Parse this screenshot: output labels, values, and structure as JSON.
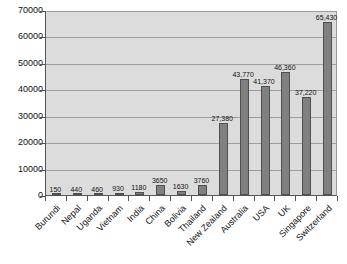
{
  "chart_data": {
    "type": "bar",
    "title": "",
    "xlabel": "",
    "ylabel": "",
    "ylim": [
      0,
      70000
    ],
    "grid": true,
    "legend": "none",
    "y_ticks": [
      {
        "value": 70000,
        "label": "70000"
      },
      {
        "value": 60000,
        "label": "60000"
      },
      {
        "value": 50000,
        "label": "50000"
      },
      {
        "value": 40000,
        "label": "40000"
      },
      {
        "value": 30000,
        "label": "30000"
      },
      {
        "value": 20000,
        "label": "20000"
      },
      {
        "value": 10000,
        "label": "10000"
      },
      {
        "value": 0,
        "label": "0"
      }
    ],
    "categories": [
      "Burundi",
      "Nepal",
      "Uganda",
      "Vietnam",
      "India",
      "China",
      "Bolivia",
      "Thailand",
      "New Zealand",
      "Australia",
      "USA",
      "UK",
      "Singapore",
      "Switzerland"
    ],
    "values": [
      150,
      440,
      460,
      930,
      1180,
      3650,
      1630,
      3760,
      27380,
      43770,
      41370,
      46360,
      37220,
      65430
    ],
    "value_labels": [
      "150",
      "440",
      "460",
      "930",
      "1180",
      "3650",
      "1630",
      "3760",
      "27,380",
      "43,770",
      "41,370",
      "46,360",
      "37,220",
      "65,430"
    ]
  },
  "colors": {
    "bar_fill": "#808080",
    "bar_border": "#4f4f4f",
    "plot_background": "#dcdcdc",
    "gridline": "#9d9d9d",
    "axis": "#555555",
    "page_background": "#ffffff",
    "text": "#111111"
  }
}
